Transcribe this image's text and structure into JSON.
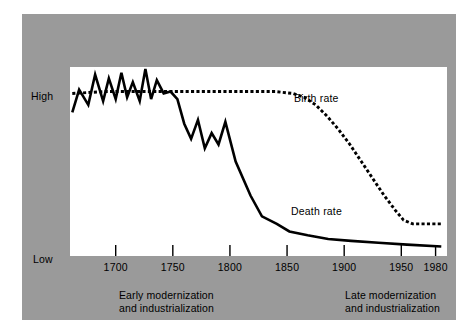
{
  "figure": {
    "background_color": "#ffffff",
    "panel_color": "#9a9a9a",
    "plot_color": "#ffffff",
    "ink_color": "#000000"
  },
  "axes": {
    "y_label_high": "High",
    "y_label_low": "Low",
    "x_tick_labels": [
      "1700",
      "1750",
      "1800",
      "1850",
      "1900",
      "1950",
      "1980"
    ]
  },
  "series_labels": {
    "birth_rate": "Birth rate",
    "death_rate": "Death rate"
  },
  "captions": {
    "early_line1": "Early modernization",
    "early_line2": "and industrialization",
    "late_line1": "Late modernization",
    "late_line2": "and industrialization"
  },
  "chart_data": {
    "type": "line",
    "title": "",
    "xlabel": "",
    "ylabel": "",
    "xlim": [
      1660,
      1990
    ],
    "ylim": [
      0,
      100
    ],
    "ytick_labels": [
      "Low",
      "High"
    ],
    "ytick_values": [
      6,
      88
    ],
    "xticks": [
      1700,
      1750,
      1800,
      1850,
      1900,
      1950,
      1980
    ],
    "grid": false,
    "legend": "inline-annotations",
    "series": [
      {
        "name": "Birth rate",
        "style": "dashed",
        "color": "#000000",
        "x": [
          1662,
          1690,
          1720,
          1750,
          1780,
          1800,
          1820,
          1840,
          1855,
          1865,
          1875,
          1885,
          1895,
          1905,
          1915,
          1925,
          1935,
          1945,
          1952,
          1960,
          1972,
          1985
        ],
        "y": [
          86,
          87,
          87,
          87,
          87,
          87,
          87,
          87,
          86,
          84,
          80,
          74,
          67,
          59,
          50,
          41,
          32,
          24,
          19,
          17,
          17,
          17
        ]
      },
      {
        "name": "Death rate",
        "style": "solid",
        "color": "#000000",
        "x": [
          1662,
          1668,
          1676,
          1682,
          1689,
          1694,
          1700,
          1705,
          1710,
          1715,
          1721,
          1726,
          1731,
          1736,
          1742,
          1748,
          1754,
          1760,
          1766,
          1772,
          1778,
          1784,
          1790,
          1796,
          1805,
          1818,
          1828,
          1841,
          1852,
          1868,
          1886,
          1906,
          1930,
          1955,
          1985
        ],
        "y": [
          76,
          88,
          80,
          96,
          82,
          94,
          83,
          97,
          84,
          92,
          82,
          99,
          83,
          93,
          86,
          87,
          83,
          70,
          62,
          72,
          57,
          65,
          59,
          71,
          50,
          32,
          21,
          17,
          13,
          11,
          9,
          8,
          7,
          6,
          5
        ]
      }
    ],
    "annotations": [
      {
        "text": "Birth rate",
        "x": 1862,
        "y": 85
      },
      {
        "text": "Death rate",
        "x": 1858,
        "y": 27
      },
      {
        "text": "Early modernization and industrialization",
        "x": 1715,
        "y": -22
      },
      {
        "text": "Late modernization and industrialization",
        "x": 1925,
        "y": -22
      }
    ]
  }
}
